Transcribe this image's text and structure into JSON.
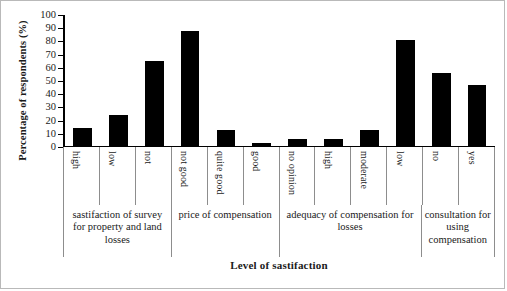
{
  "chart_data": {
    "type": "bar",
    "title": "",
    "xlabel": "Level of sastifaction",
    "ylabel": "Percentage of respondents (%)",
    "ylim": [
      0,
      100
    ],
    "yticks": [
      0,
      10,
      20,
      30,
      40,
      50,
      60,
      70,
      80,
      90,
      100
    ],
    "grid": false,
    "legend": "none",
    "bar_color": "#000000",
    "categories": [
      "high",
      "low",
      "not",
      "not good",
      "quite good",
      "good",
      "no opinion",
      "high",
      "moderate",
      "low",
      "no",
      "yes"
    ],
    "values": [
      13,
      23,
      64,
      87,
      12,
      2,
      5,
      5,
      12,
      80,
      55,
      46
    ],
    "groups": [
      {
        "label": "sastifaction of survey for property and land losses",
        "span": 3
      },
      {
        "label": "price of compensation",
        "span": 3
      },
      {
        "label": "adequacy of compensation for losses",
        "span": 4
      },
      {
        "label": "consultation for using compensation",
        "span": 2
      }
    ]
  }
}
